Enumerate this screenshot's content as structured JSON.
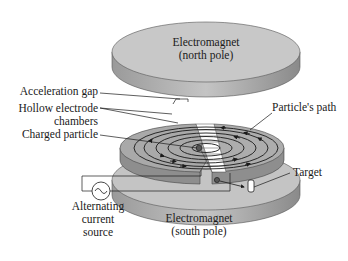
{
  "diagram": {
    "labels": {
      "north_magnet_line1": "Electromagnet",
      "north_magnet_line2": "(north pole)",
      "acceleration_gap": "Acceleration gap",
      "hollow_chambers_line1": "Hollow electrode",
      "hollow_chambers_line2": "chambers",
      "charged_particle": "Charged particle",
      "particles_path": "Particle's path",
      "target": "Target",
      "ac_source_line1": "Alternating",
      "ac_source_line2": "current",
      "ac_source_line3": "source",
      "south_magnet_line1": "Electromagnet",
      "south_magnet_line2": "(south pole)"
    },
    "colors": {
      "disk_top": "#bdbdbd",
      "disk_side": "#8c8c8c",
      "dee_top": "#a8a8a8",
      "line": "#1a1a1a"
    }
  }
}
